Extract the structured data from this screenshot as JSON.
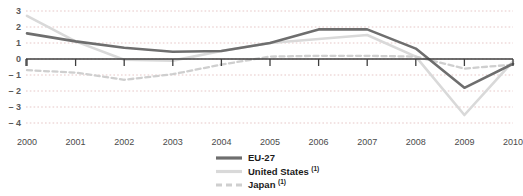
{
  "chart_data": {
    "type": "line",
    "title": "",
    "subtitle": "",
    "xlabel": "",
    "ylabel": "",
    "x": [
      2000,
      2001,
      2002,
      2003,
      2004,
      2005,
      2006,
      2007,
      2008,
      2009,
      2010
    ],
    "categories": [
      "2000",
      "2001",
      "2002",
      "2003",
      "2004",
      "2005",
      "2006",
      "2007",
      "2008",
      "2009",
      "2010"
    ],
    "xlim": [
      2000,
      2010
    ],
    "ylim": [
      -4,
      3
    ],
    "yticks": [
      3,
      2,
      1,
      0,
      -1,
      -2,
      -3,
      -4
    ],
    "ytick_labels": [
      "3",
      "2",
      "1",
      "0",
      "– 1",
      "– 2",
      "– 3",
      "– 4"
    ],
    "grid": true,
    "grid_axis": "y",
    "legend_position": "bottom-center",
    "series": [
      {
        "name": "EU-27",
        "label": "EU-27",
        "footnote": "",
        "color": "#6e6e6e",
        "style": "solid",
        "width": 2.6,
        "values": [
          1.6,
          1.1,
          0.7,
          0.45,
          0.5,
          1.0,
          1.85,
          1.85,
          0.65,
          -1.8,
          -0.3
        ]
      },
      {
        "name": "United States",
        "label": "United States",
        "footnote": "1",
        "color": "#d9d9d9",
        "style": "solid",
        "width": 2.6,
        "values": [
          2.7,
          1.1,
          -0.05,
          -0.1,
          0.5,
          1.0,
          1.25,
          1.5,
          0.15,
          -3.5,
          -0.15
        ]
      },
      {
        "name": "Japan",
        "label": "Japan",
        "footnote": "1",
        "color": "#cfcfcf",
        "style": "dashed",
        "width": 2.3,
        "values": [
          -0.7,
          -0.85,
          -1.3,
          -0.95,
          -0.35,
          0.15,
          0.2,
          0.2,
          0.15,
          -0.6,
          -0.35
        ]
      }
    ]
  },
  "axis": {
    "zero_line_color": "#3f3f3f",
    "grid_color": "#e0b9b9",
    "tick_color": "#3f3f3f"
  },
  "legend": {
    "entries": [
      {
        "label": "EU-27",
        "sup": ""
      },
      {
        "label": "United States",
        "sup": "1"
      },
      {
        "label": "Japan",
        "sup": "1"
      }
    ]
  }
}
